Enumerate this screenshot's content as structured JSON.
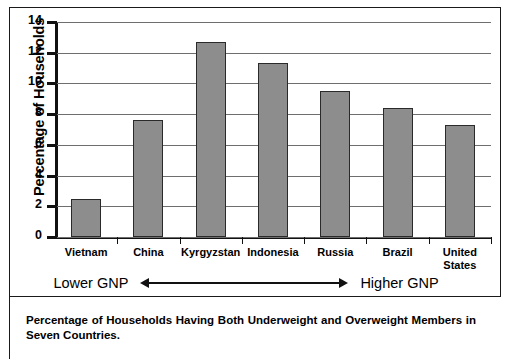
{
  "figure": {
    "caption": "Percentage of Households Having Both Underweight and Overweight Members in Seven Countries.",
    "gnp_left_label": "Lower GNP",
    "gnp_right_label": "Higher GNP"
  },
  "chart_data": {
    "type": "bar",
    "title": "",
    "xlabel": "",
    "ylabel": "Percentage of Households",
    "ylim": [
      0,
      14
    ],
    "yticks": [
      0,
      2,
      4,
      6,
      8,
      10,
      12,
      14
    ],
    "ytick_labels": [
      "0",
      "2",
      "4",
      "6",
      "8",
      "10",
      "12",
      "14"
    ],
    "grid": true,
    "legend": null,
    "categories": [
      "Vietnam",
      "China",
      "Kyrgyzstan",
      "Indonesia",
      "Russia",
      "Brazil",
      "United\nStates"
    ],
    "values": [
      2.5,
      7.6,
      12.7,
      11.3,
      9.5,
      8.4,
      7.3
    ],
    "bar_color": "#8d8d8d",
    "bar_edge_color": "#2a2a2a",
    "annotations": [
      {
        "text": "Lower GNP",
        "position": "below-axis-left"
      },
      {
        "text": "Higher GNP",
        "position": "below-axis-right"
      }
    ]
  }
}
